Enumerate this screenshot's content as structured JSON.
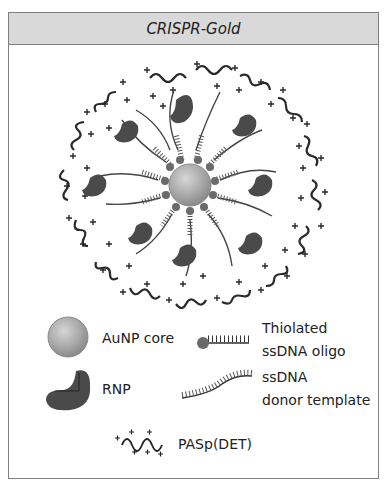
{
  "title": "CRISPR-Gold",
  "colors": {
    "header_fill": "#d9d9d9",
    "border": "#7f7f7f",
    "core": "#a9a9a9",
    "rnp": "#4a4a4a",
    "strand": "#333333"
  },
  "diagram": {
    "center_component": "AuNP core",
    "rings": [
      "Thiolated ssDNA oligo",
      "ssDNA donor template",
      "RNP",
      "PASp(DET)"
    ]
  },
  "legend": {
    "aunp": {
      "label": "AuNP core",
      "icon": "gold-nanoparticle-icon"
    },
    "rnp": {
      "label": "RNP",
      "icon": "rnp-icon"
    },
    "thiolated": {
      "line1": "Thiolated",
      "line2": "ssDNA oligo",
      "icon": "thiolated-oligo-icon"
    },
    "donor": {
      "line1": "ssDNA",
      "line2": "donor template",
      "icon": "donor-strand-icon"
    },
    "paspdet": {
      "label": "PASp(DET)",
      "icon": "cationic-polymer-icon"
    }
  }
}
